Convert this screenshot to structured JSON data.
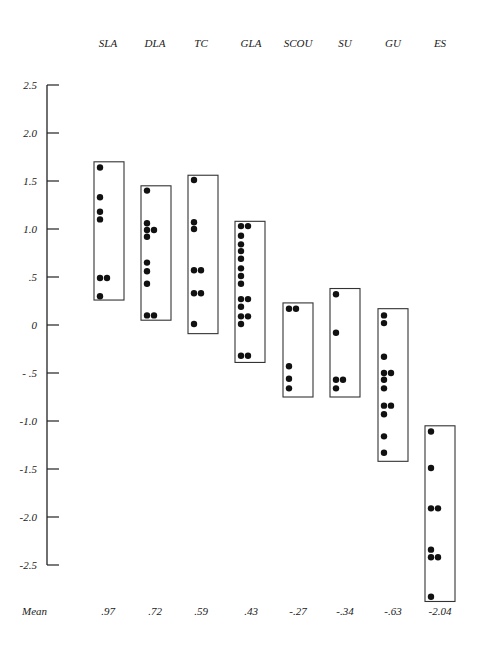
{
  "chart_data": {
    "type": "scatter",
    "subtype": "grouped dot plot with enclosing range boxes",
    "title": "",
    "xlabel": "",
    "ylabel": "",
    "ylim": [
      -2.5,
      2.5
    ],
    "yticks": [
      2.5,
      2.0,
      1.5,
      1.0,
      0.5,
      0,
      -0.5,
      -1.0,
      -1.5,
      -2.0,
      -2.5
    ],
    "ytick_labels": [
      "2.5",
      "2.0",
      "1.5",
      "1.0",
      ".5",
      "0",
      "- .5",
      "-1.0",
      "-1.5",
      "-2.0",
      "-2.5"
    ],
    "grid": false,
    "legend": null,
    "categories": [
      "SLA",
      "DLA",
      "TC",
      "GLA",
      "SCOU",
      "SU",
      "GU",
      "ES"
    ],
    "mean_label": "Mean",
    "means": [
      0.97,
      0.72,
      0.59,
      0.43,
      -0.27,
      -0.34,
      -0.63,
      -2.04
    ],
    "mean_labels": [
      ".97",
      ".72",
      ".59",
      ".43",
      "-.27",
      "-.34",
      "-.63",
      "-2.04"
    ],
    "groups": [
      {
        "name": "SLA",
        "box": [
          0.26,
          1.7
        ],
        "points": [
          1.64,
          1.33,
          1.18,
          1.1,
          0.49,
          0.49,
          0.3
        ]
      },
      {
        "name": "DLA",
        "box": [
          0.05,
          1.45
        ],
        "points": [
          1.4,
          1.06,
          0.99,
          0.99,
          0.92,
          0.65,
          0.56,
          0.43,
          0.1,
          0.1
        ]
      },
      {
        "name": "TC",
        "box": [
          -0.09,
          1.56
        ],
        "points": [
          1.51,
          1.07,
          1.0,
          0.57,
          0.57,
          0.33,
          0.33,
          0.01
        ]
      },
      {
        "name": "GLA",
        "box": [
          -0.39,
          1.08
        ],
        "points": [
          1.03,
          1.03,
          0.93,
          0.84,
          0.77,
          0.69,
          0.59,
          0.51,
          0.43,
          0.27,
          0.27,
          0.19,
          0.09,
          0.09,
          0.01,
          -0.32,
          -0.32
        ]
      },
      {
        "name": "SCOU",
        "box": [
          -0.75,
          0.23
        ],
        "points": [
          0.17,
          0.17,
          -0.43,
          -0.56,
          -0.66
        ]
      },
      {
        "name": "SU",
        "box": [
          -0.75,
          0.38
        ],
        "points": [
          0.32,
          -0.08,
          -0.57,
          -0.57,
          -0.66
        ]
      },
      {
        "name": "GU",
        "box": [
          -1.42,
          0.17
        ],
        "points": [
          0.1,
          0.02,
          -0.33,
          -0.5,
          -0.5,
          -0.57,
          -0.66,
          -0.84,
          -0.84,
          -0.93,
          -1.16,
          -1.33
        ]
      },
      {
        "name": "ES",
        "box": [
          -2.88,
          -1.05
        ],
        "points": [
          -1.11,
          -1.49,
          -1.91,
          -1.91,
          -2.34,
          -2.42,
          -2.42,
          -2.83
        ]
      }
    ]
  }
}
